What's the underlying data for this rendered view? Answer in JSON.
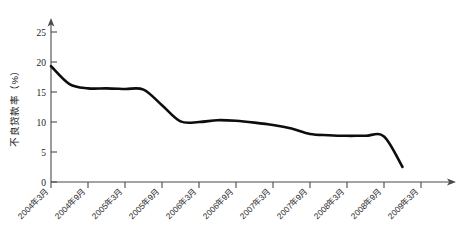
{
  "chart_data": {
    "type": "line",
    "title": "",
    "xlabel": "",
    "ylabel": "不良贷款率（%）",
    "ylim": [
      0,
      27
    ],
    "yticks": [
      0,
      5,
      10,
      15,
      20,
      25
    ],
    "ytick_labels": [
      "0",
      "5",
      "10",
      "15",
      "20",
      "25"
    ],
    "grid": false,
    "legend": "none",
    "categories": [
      "2004年3月",
      "2004年9月",
      "2005年3月",
      "2005年9月",
      "2006年3月",
      "2006年9月",
      "2007年3月",
      "2007年9月",
      "2008年3月",
      "2008年9月",
      "2009年3月"
    ],
    "series": [
      {
        "name": "不良贷款率",
        "x": [
          "2004年3月",
          "2004年6月",
          "2004年9月",
          "2004年12月",
          "2005年3月",
          "2005年6月",
          "2005年9月",
          "2005年12月",
          "2006年3月",
          "2006年6月",
          "2006年9月",
          "2006年12月",
          "2007年3月",
          "2007年6月",
          "2007年9月",
          "2007年12月",
          "2008年3月",
          "2008年6月",
          "2008年9月",
          "2008年12月"
        ],
        "values": [
          19.3,
          16.3,
          15.6,
          15.6,
          15.5,
          15.4,
          12.8,
          10.1,
          10.0,
          10.3,
          10.2,
          9.9,
          9.5,
          8.9,
          8.0,
          7.8,
          7.7,
          7.7,
          7.6,
          2.5
        ]
      }
    ]
  }
}
